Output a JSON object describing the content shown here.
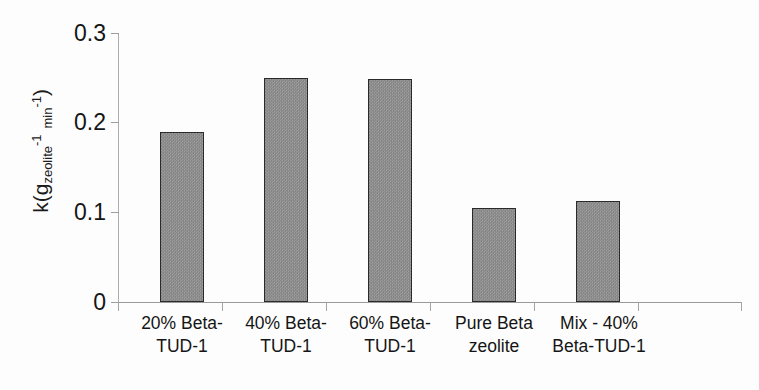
{
  "chart_data": {
    "type": "bar",
    "title": "",
    "subtitle": "",
    "xlabel": "",
    "ylabel": "k(g_zeolite^-1 min^-1)",
    "ylabel_parts": {
      "lead": "k(g",
      "sub1": "zeolite",
      "sup1": "-1",
      "sub2": "min",
      "sup2": "-1",
      "tail": ")"
    },
    "categories": [
      "20% Beta-TUD-1",
      "40% Beta-TUD-1",
      "60% Beta-TUD-1",
      "Pure Beta zeolite",
      "Mix - 40% Beta-TUD-1"
    ],
    "category_lines": [
      [
        "20% Beta-",
        "TUD-1"
      ],
      [
        "40% Beta-",
        "TUD-1"
      ],
      [
        "60% Beta-",
        "TUD-1"
      ],
      [
        "Pure Beta",
        "zeolite"
      ],
      [
        "Mix - 40%",
        "Beta-TUD-1"
      ]
    ],
    "values": [
      0.19,
      0.25,
      0.249,
      0.105,
      0.113
    ],
    "ylim": [
      0,
      0.3
    ],
    "yticks": [
      0.3,
      0.2,
      0.1,
      0
    ],
    "ytick_labels": [
      "0.3",
      "0.2",
      "0.1",
      "0"
    ],
    "grid": false,
    "legend": null,
    "legend_position": "none",
    "colors": {
      "bar_fill": "#8b8b8b",
      "bar_border": "#2a2a2a",
      "axis": "#9e9e9e",
      "text": "#151515",
      "background": "#fdfdfd"
    }
  }
}
